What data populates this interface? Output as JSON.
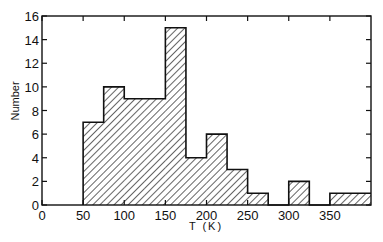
{
  "chart_data": {
    "type": "bar",
    "subtype": "histogram",
    "title": "",
    "xlabel": "T (K)",
    "ylabel": "Number",
    "xlim": [
      0,
      400
    ],
    "ylim": [
      0,
      16
    ],
    "bin_width": 25,
    "bins": [
      {
        "x0": 50,
        "x1": 75,
        "count": 7
      },
      {
        "x0": 75,
        "x1": 100,
        "count": 10
      },
      {
        "x0": 100,
        "x1": 125,
        "count": 9
      },
      {
        "x0": 125,
        "x1": 150,
        "count": 9
      },
      {
        "x0": 150,
        "x1": 175,
        "count": 15
      },
      {
        "x0": 175,
        "x1": 200,
        "count": 4
      },
      {
        "x0": 200,
        "x1": 225,
        "count": 6
      },
      {
        "x0": 225,
        "x1": 250,
        "count": 3
      },
      {
        "x0": 250,
        "x1": 275,
        "count": 1
      },
      {
        "x0": 275,
        "x1": 300,
        "count": 0
      },
      {
        "x0": 300,
        "x1": 325,
        "count": 2
      },
      {
        "x0": 325,
        "x1": 350,
        "count": 0
      },
      {
        "x0": 350,
        "x1": 375,
        "count": 1
      },
      {
        "x0": 375,
        "x1": 400,
        "count": 1
      }
    ],
    "x_ticks": [
      0,
      50,
      100,
      150,
      200,
      250,
      300,
      350
    ],
    "y_ticks": [
      0,
      2,
      4,
      6,
      8,
      10,
      12,
      14,
      16
    ],
    "fill": "diagonal-hatch",
    "grid": false,
    "legend": null
  }
}
